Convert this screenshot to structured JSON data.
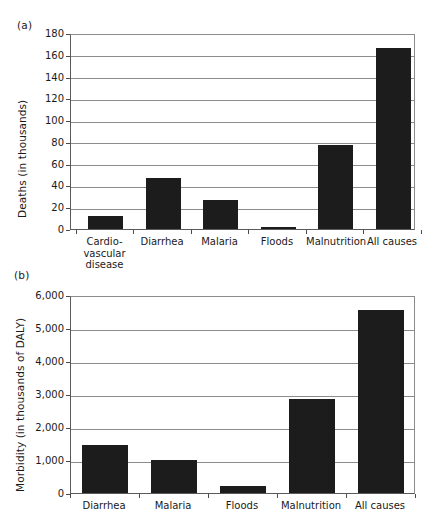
{
  "figure": {
    "panels": [
      {
        "id": "a",
        "letter": "(a)",
        "ylabel": "Deaths (in thousands)"
      },
      {
        "id": "b",
        "letter": "(b)",
        "ylabel": "Morbidity (in thousands of DALY)"
      }
    ]
  },
  "chart_data": [
    {
      "type": "bar",
      "panel": "(a)",
      "title": "",
      "xlabel": "",
      "ylabel": "Deaths (in thousands)",
      "categories": [
        "Cardio-\nvascular\ndisease",
        "Diarrhea",
        "Malaria",
        "Floods",
        "Malnutrition",
        "All causes"
      ],
      "values": [
        12,
        47,
        27,
        2,
        77,
        166
      ],
      "ylim": [
        0,
        180
      ],
      "yticks": [
        0,
        20,
        40,
        60,
        80,
        100,
        120,
        140,
        160,
        180
      ],
      "ytick_labels": [
        "0",
        "20",
        "40",
        "60",
        "80",
        "100",
        "120",
        "140",
        "160",
        "180"
      ],
      "grid": true,
      "legend": false,
      "bar_color": "#1c1c1c"
    },
    {
      "type": "bar",
      "panel": "(b)",
      "title": "",
      "xlabel": "",
      "ylabel": "Morbidity (in thousands of DALY)",
      "categories": [
        "Diarrhea",
        "Malaria",
        "Floods",
        "Malnutrition",
        "All causes"
      ],
      "values": [
        1450,
        1010,
        200,
        2850,
        5550
      ],
      "ylim": [
        0,
        6000
      ],
      "yticks": [
        0,
        1000,
        2000,
        3000,
        4000,
        5000,
        6000
      ],
      "ytick_labels": [
        "0",
        "1,000",
        "2,000",
        "3,000",
        "4,000",
        "5,000",
        "6,000"
      ],
      "grid": true,
      "legend": false,
      "bar_color": "#1c1c1c"
    }
  ]
}
